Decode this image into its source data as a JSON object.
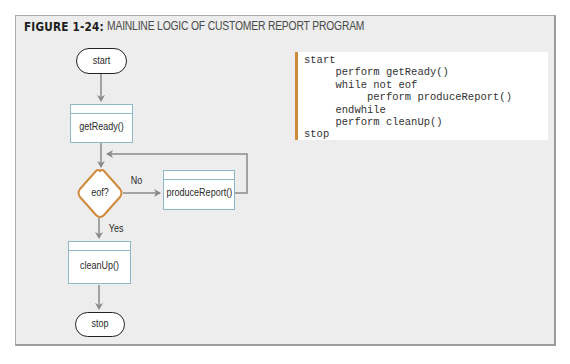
{
  "figure": {
    "label": "FIGURE 1-24:",
    "title": "MAINLINE LOGIC OF CUSTOMER REPORT PROGRAM"
  },
  "flowchart": {
    "start": "start",
    "get_ready": "getReady()",
    "decision": "eof?",
    "no_label": "No",
    "yes_label": "Yes",
    "produce_report": "produceReport()",
    "clean_up": "cleanUp()",
    "stop": "stop"
  },
  "pseudocode": {
    "lines": [
      "start",
      "     perform getReady()",
      "     while not eof",
      "          perform produceReport()",
      "     endwhile",
      "     perform cleanUp()",
      "stop"
    ]
  },
  "colors": {
    "panel_bg": "#ecedec",
    "process_border": "#8fb8c6",
    "decision_border": "#d08a3c",
    "code_accent": "#d08a3c",
    "connector": "#8a8a8a"
  }
}
